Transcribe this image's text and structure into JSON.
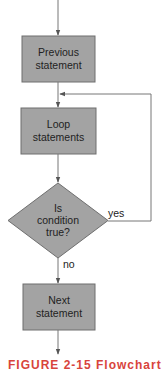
{
  "diagram": {
    "type": "flowchart",
    "colors": {
      "box_fill": "#a3a3a3",
      "box_stroke": "#6e6e6e",
      "line": "#777777",
      "text": "#222222",
      "caption": "#d8443c"
    },
    "nodes": [
      {
        "id": "previous",
        "shape": "rectangle",
        "line1": "Previous",
        "line2": "statement"
      },
      {
        "id": "loop",
        "shape": "rectangle",
        "line1": "Loop",
        "line2": "statements"
      },
      {
        "id": "condition",
        "shape": "diamond",
        "line1": "Is",
        "line2": "condition",
        "line3": "true?"
      },
      {
        "id": "next",
        "shape": "rectangle",
        "line1": "Next",
        "line2": "statement"
      }
    ],
    "edges": [
      {
        "from": "start",
        "to": "previous"
      },
      {
        "from": "previous",
        "to": "loop"
      },
      {
        "from": "loop",
        "to": "condition"
      },
      {
        "from": "condition",
        "to": "loop",
        "label": "yes"
      },
      {
        "from": "condition",
        "to": "next",
        "label": "no"
      },
      {
        "from": "next",
        "to": "end"
      }
    ],
    "labels": {
      "yes": "yes",
      "no": "no"
    }
  },
  "caption": "FIGURE 2-15 Flowchart"
}
